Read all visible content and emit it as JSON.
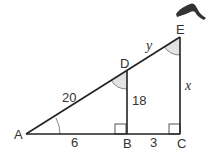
{
  "diagram": {
    "type": "similar-triangles",
    "points": {
      "A": {
        "label": "A",
        "x": 26,
        "y": 134
      },
      "B": {
        "label": "B",
        "x": 127,
        "y": 134
      },
      "C": {
        "label": "C",
        "x": 180,
        "y": 134
      },
      "D": {
        "label": "D",
        "x": 127,
        "y": 71
      },
      "E": {
        "label": "E",
        "x": 180,
        "y": 37
      }
    },
    "lengths": {
      "AD": "20",
      "DB": "18",
      "AB": "6",
      "BC": "3",
      "DE": "y",
      "EC": "x"
    },
    "right_angles": [
      "B",
      "C"
    ],
    "marked_angles": [
      "A",
      "D",
      "E"
    ],
    "colors": {
      "line": "#222222",
      "angle_fill": "#e3e3e3",
      "text": "#333333"
    }
  }
}
